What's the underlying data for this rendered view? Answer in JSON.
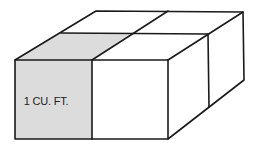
{
  "diagram": {
    "type": "isometric-block",
    "unit_label": "1 CU. FT.",
    "colors": {
      "highlight_fill": "#dcdcdc",
      "face_fill": "#ffffff",
      "stroke": "#1a1a1a",
      "text": "#222222"
    },
    "cubes": [
      {
        "id": "front-left",
        "highlighted": true,
        "label": "1 CU. FT."
      },
      {
        "id": "front-right",
        "highlighted": false
      },
      {
        "id": "back-left",
        "highlighted": false
      },
      {
        "id": "back-right",
        "highlighted": false
      }
    ]
  }
}
